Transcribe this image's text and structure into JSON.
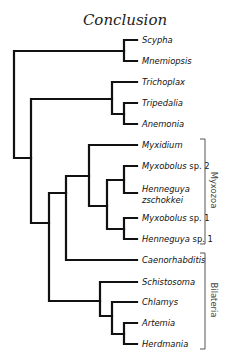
{
  "title": "Conclusion",
  "colors": {
    "branch": "#111111",
    "bracket": "#555555",
    "text": "#111111"
  },
  "taxa": [
    {
      "id": "scypha",
      "italic": "Scypha",
      "suffix": "",
      "y": 40
    },
    {
      "id": "mnemiopsis",
      "italic": "Mnemiopsis",
      "suffix": "",
      "y": 61
    },
    {
      "id": "trichoplax",
      "italic": "Trichoplax",
      "suffix": "",
      "y": 82
    },
    {
      "id": "tripedalia",
      "italic": "Tripedalia",
      "suffix": "",
      "y": 103
    },
    {
      "id": "anemonia",
      "italic": "Anemonia",
      "suffix": "",
      "y": 124
    },
    {
      "id": "myxidium",
      "italic": "Myxidium",
      "suffix": "",
      "y": 145
    },
    {
      "id": "myxobolus-sp2",
      "italic": "Myxobolus",
      "suffix": " sp. 2",
      "y": 166
    },
    {
      "id": "henneguya-zschokkei",
      "italic": "Henneguya",
      "line2": "zschokkei",
      "suffix": "",
      "y": 193
    },
    {
      "id": "myxobolus-sp1",
      "italic": "Myxobolus",
      "suffix": " sp. 1",
      "y": 218
    },
    {
      "id": "henneguya-sp1",
      "italic": "Henneguya",
      "suffix": " sp. 1",
      "y": 239
    },
    {
      "id": "caenorhabditis",
      "italic": "Caenorhabditis",
      "suffix": "",
      "y": 260
    },
    {
      "id": "schistosoma",
      "italic": "Schistosoma",
      "suffix": "",
      "y": 282
    },
    {
      "id": "chlamys",
      "italic": "Chlamys",
      "suffix": "",
      "y": 302
    },
    {
      "id": "artemia",
      "italic": "Artemia",
      "suffix": "",
      "y": 323
    },
    {
      "id": "herdmania",
      "italic": "Herdmania",
      "suffix": "",
      "y": 344
    }
  ],
  "groups": [
    {
      "id": "myxozoa",
      "label": "Myxozoa",
      "x": 205,
      "y1": 139,
      "y2": 244
    },
    {
      "id": "bilateria",
      "label": "Bilateria",
      "x": 205,
      "y1": 253,
      "y2": 349
    }
  ]
}
